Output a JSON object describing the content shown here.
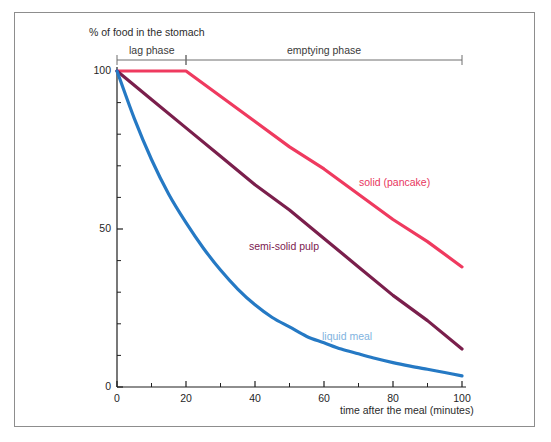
{
  "figure": {
    "background_color": "#ffffff",
    "frame_color": "#8d8d8d"
  },
  "axes": {
    "y_axis_title": "% of food in the stomach",
    "x_axis_title": "time after the meal (minutes)",
    "y_ticks": [
      "0",
      "50",
      "100"
    ],
    "x_ticks": [
      "0",
      "20",
      "40",
      "60",
      "80",
      "100"
    ]
  },
  "phases": {
    "lag": "lag phase",
    "emptying": "emptying phase"
  },
  "series_labels": {
    "solid": "solid (pancake)",
    "semi_solid": "semi-solid pulp",
    "liquid": "liquid meal"
  },
  "chart_data": {
    "type": "line",
    "title": "",
    "xlabel": "time after the meal (minutes)",
    "ylabel": "% of food in the stomach",
    "xlim": [
      0,
      100
    ],
    "ylim": [
      0,
      100
    ],
    "grid": false,
    "legend_position": "inline-annotations",
    "x_major_ticks": [
      0,
      20,
      40,
      60,
      80,
      100
    ],
    "x_minor_ticks": [
      10,
      30,
      50,
      70,
      90
    ],
    "y_major_ticks": [
      0,
      50,
      100
    ],
    "y_minor_ticks": [
      10,
      20,
      30,
      40,
      60,
      70,
      80,
      90
    ],
    "annotations": [
      {
        "text": "lag phase",
        "x_range": [
          0,
          20
        ]
      },
      {
        "text": "emptying phase",
        "x_range": [
          20,
          100
        ]
      }
    ],
    "series": [
      {
        "name": "solid (pancake)",
        "color": "#ef3a5f",
        "label_x": 78,
        "label_y": 63,
        "x": [
          0,
          5,
          10,
          15,
          20,
          30,
          40,
          50,
          60,
          70,
          80,
          90,
          100
        ],
        "values": [
          100,
          100,
          100,
          100,
          100,
          92,
          84,
          76,
          69,
          61,
          53,
          46,
          38
        ]
      },
      {
        "name": "semi-solid pulp",
        "color": "#7a1f4c",
        "label_x": 39,
        "label_y": 43,
        "x": [
          0,
          10,
          20,
          30,
          40,
          50,
          60,
          70,
          80,
          90,
          100
        ],
        "values": [
          100,
          91,
          82,
          73,
          64,
          56,
          47,
          38,
          29,
          21,
          12
        ]
      },
      {
        "name": "liquid meal",
        "color": "#2579c4",
        "label_x": 63,
        "label_y": 16,
        "x": [
          0,
          5,
          10,
          15,
          20,
          25,
          30,
          35,
          40,
          45,
          50,
          55,
          60,
          65,
          70,
          75,
          80,
          85,
          90,
          95,
          100
        ],
        "values": [
          100,
          85,
          72,
          61,
          52,
          44,
          37,
          31,
          26,
          22,
          19,
          16,
          14,
          12,
          10.5,
          9,
          7.7,
          6.6,
          5.6,
          4.6,
          3.5
        ]
      }
    ]
  }
}
